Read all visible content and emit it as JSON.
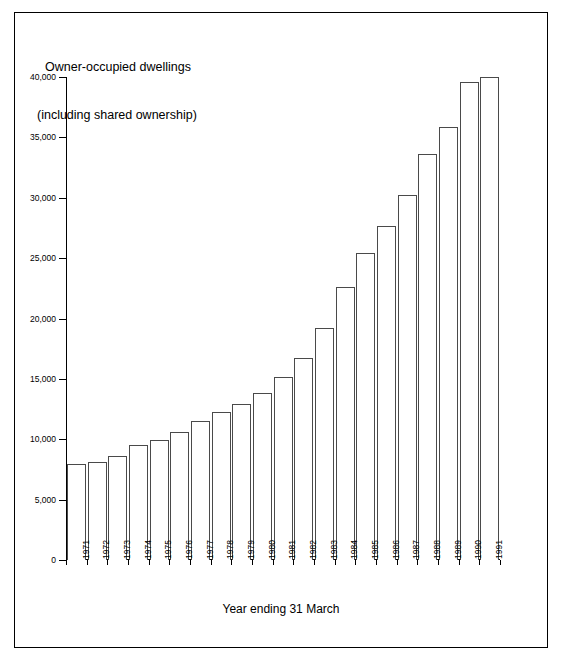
{
  "figure": {
    "title_line1": "Owner-occupied dwellings",
    "title_line2": "(including shared ownership)",
    "frame_color": "#000000",
    "bar_fill": "#ffffff",
    "bar_outline": "#4a4a4a"
  },
  "chart_data": {
    "type": "bar",
    "title": "Owner-occupied dwellings (including shared ownership)",
    "xlabel": "Year ending 31 March",
    "ylabel": "",
    "ylim": [
      0,
      40000
    ],
    "ytick_labels": [
      "0",
      "5,000",
      "10,000",
      "15,000",
      "20,000",
      "25,000",
      "30,000",
      "35,000",
      "40,000"
    ],
    "ytick_values": [
      0,
      5000,
      10000,
      15000,
      20000,
      25000,
      30000,
      35000,
      40000
    ],
    "grid": false,
    "legend": null,
    "categories": [
      "1971",
      "1972",
      "1973",
      "1974",
      "1975",
      "1976",
      "1977",
      "1978",
      "1979",
      "1980",
      "1981",
      "1982",
      "1983",
      "1984",
      "1985",
      "1986",
      "1987",
      "1988",
      "1989",
      "1990",
      "1991"
    ],
    "values": [
      7950,
      8150,
      8650,
      9550,
      9950,
      10600,
      11500,
      12250,
      12900,
      13850,
      15150,
      16700,
      19200,
      22650,
      25450,
      27650,
      30200,
      33650,
      35850,
      39550,
      40000
    ]
  }
}
